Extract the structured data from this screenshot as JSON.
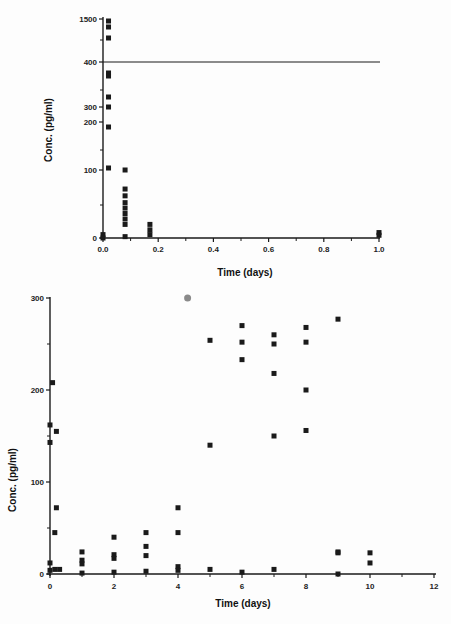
{
  "chart_data": [
    {
      "type": "scatter",
      "title": "",
      "xlabel": "Time  (days)",
      "ylabel": "Conc.  (pg/ml)",
      "xlim": [
        0,
        1.0
      ],
      "x_ticks": [
        "0.0",
        "0.2",
        "0.4",
        "0.6",
        "0.8",
        "1.0"
      ],
      "y_ticks": [
        "0",
        "100",
        "200",
        "300",
        "400",
        "1500"
      ],
      "y_axis_note": "broken scale above 400 up to 1500",
      "reference_line": {
        "y": 400,
        "label": "400"
      },
      "grid": false,
      "series": [
        {
          "name": "concentration",
          "points": [
            {
              "x": 0.0,
              "y": 5
            },
            {
              "x": 0.0,
              "y": 0
            },
            {
              "x": 0.02,
              "y": 1450
            },
            {
              "x": 0.02,
              "y": 1300
            },
            {
              "x": 0.02,
              "y": 950
            },
            {
              "x": 0.02,
              "y": 375
            },
            {
              "x": 0.02,
              "y": 365
            },
            {
              "x": 0.02,
              "y": 320
            },
            {
              "x": 0.02,
              "y": 300
            },
            {
              "x": 0.02,
              "y": 255
            },
            {
              "x": 0.02,
              "y": 160
            },
            {
              "x": 0.08,
              "y": 100
            },
            {
              "x": 0.08,
              "y": 72
            },
            {
              "x": 0.08,
              "y": 62
            },
            {
              "x": 0.08,
              "y": 52
            },
            {
              "x": 0.08,
              "y": 44
            },
            {
              "x": 0.08,
              "y": 36
            },
            {
              "x": 0.08,
              "y": 28
            },
            {
              "x": 0.08,
              "y": 20
            },
            {
              "x": 0.08,
              "y": 2
            },
            {
              "x": 0.17,
              "y": 20
            },
            {
              "x": 0.17,
              "y": 12
            },
            {
              "x": 0.17,
              "y": 5
            },
            {
              "x": 1.0,
              "y": 8
            },
            {
              "x": 1.0,
              "y": 4
            }
          ]
        }
      ]
    },
    {
      "type": "scatter",
      "title": "",
      "xlabel": "Time  (days)",
      "ylabel": "Conc.  (pg/ml)",
      "xlim": [
        0,
        12
      ],
      "ylim": [
        0,
        300
      ],
      "x_ticks": [
        "0",
        "2",
        "4",
        "6",
        "8",
        "10",
        "12"
      ],
      "y_ticks": [
        "0",
        "100",
        "200",
        "300"
      ],
      "grid": false,
      "series": [
        {
          "name": "concentration",
          "points": [
            {
              "x": 0,
              "y": 162
            },
            {
              "x": 0,
              "y": 143
            },
            {
              "x": 0,
              "y": 12
            },
            {
              "x": 0,
              "y": 4
            },
            {
              "x": 0.08,
              "y": 208
            },
            {
              "x": 0.15,
              "y": 45
            },
            {
              "x": 0.2,
              "y": 155
            },
            {
              "x": 0.2,
              "y": 72
            },
            {
              "x": 0.15,
              "y": 5
            },
            {
              "x": 0.3,
              "y": 5
            },
            {
              "x": 1,
              "y": 24
            },
            {
              "x": 1,
              "y": 15
            },
            {
              "x": 1,
              "y": 11
            },
            {
              "x": 1,
              "y": 1
            },
            {
              "x": 2,
              "y": 40
            },
            {
              "x": 2,
              "y": 21
            },
            {
              "x": 2,
              "y": 17
            },
            {
              "x": 2,
              "y": 2
            },
            {
              "x": 3,
              "y": 45
            },
            {
              "x": 3,
              "y": 30
            },
            {
              "x": 3,
              "y": 20
            },
            {
              "x": 3,
              "y": 3
            },
            {
              "x": 4,
              "y": 72
            },
            {
              "x": 4,
              "y": 45
            },
            {
              "x": 4,
              "y": 8
            },
            {
              "x": 4,
              "y": 4
            },
            {
              "x": 5,
              "y": 254
            },
            {
              "x": 5,
              "y": 140
            },
            {
              "x": 5,
              "y": 5
            },
            {
              "x": 6,
              "y": 270
            },
            {
              "x": 6,
              "y": 252
            },
            {
              "x": 6,
              "y": 233
            },
            {
              "x": 6,
              "y": 2
            },
            {
              "x": 7,
              "y": 260
            },
            {
              "x": 7,
              "y": 250
            },
            {
              "x": 7,
              "y": 218
            },
            {
              "x": 7,
              "y": 150
            },
            {
              "x": 7,
              "y": 5
            },
            {
              "x": 8,
              "y": 268
            },
            {
              "x": 8,
              "y": 252
            },
            {
              "x": 8,
              "y": 200
            },
            {
              "x": 8,
              "y": 156
            },
            {
              "x": 9,
              "y": 277
            },
            {
              "x": 9,
              "y": 24
            },
            {
              "x": 9,
              "y": 23
            },
            {
              "x": 9,
              "y": 0
            },
            {
              "x": 10,
              "y": 23
            },
            {
              "x": 10,
              "y": 12
            }
          ]
        },
        {
          "name": "outlier-gray",
          "points": [
            {
              "x": 4.3,
              "y": 300
            }
          ]
        }
      ]
    }
  ],
  "top_chart": {
    "y_label": "Conc.  (pg/ml)",
    "x_label": "Time  (days)",
    "y_ticks": [
      {
        "label": "1500",
        "py": 19
      },
      {
        "label": "400",
        "py": 62
      },
      {
        "label": "300",
        "py": 107
      },
      {
        "label": "200",
        "py": 122
      },
      {
        "label": "100",
        "py": 170
      },
      {
        "label": "0",
        "py": 238
      }
    ],
    "x_ticks": [
      "0.0",
      "0.2",
      "0.4",
      "0.6",
      "0.8",
      "1.0"
    ]
  },
  "bottom_chart": {
    "y_label": "Conc.  (pg/ml)",
    "x_label": "Time  (days)",
    "y_ticks": [
      "0",
      "100",
      "200",
      "300"
    ],
    "x_ticks": [
      "0",
      "2",
      "4",
      "6",
      "8",
      "10",
      "12"
    ]
  },
  "colors": {
    "ink": "#1a1a1a",
    "background": "#fdfdfd",
    "gray_point": "#8a8a8a"
  }
}
